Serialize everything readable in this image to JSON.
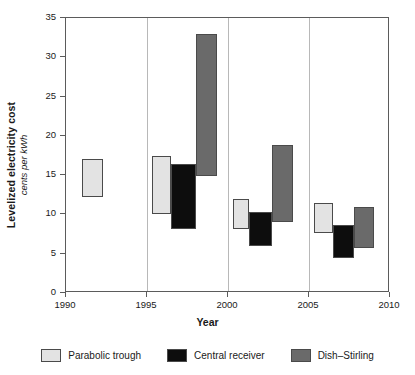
{
  "chart_data": {
    "type": "bar",
    "title": "",
    "xlabel": "Year",
    "ylabel": "Levelized electricity cost",
    "ylabel_sub": "cents per kWh",
    "xlim": [
      1990,
      2010
    ],
    "ylim": [
      0,
      35
    ],
    "yticks": [
      0,
      5,
      10,
      15,
      20,
      25,
      30,
      35
    ],
    "ytick_labels": [
      "0",
      "5",
      "10",
      "15",
      "20",
      "25",
      "30",
      "35"
    ],
    "xticks": [
      1990,
      1995,
      2000,
      2005,
      2010
    ],
    "xtick_labels": [
      "1990",
      "1995",
      "2000",
      "2005",
      "2010"
    ],
    "grid": "vertical gridlines at 1995, 2000, 2005",
    "legend_position": "below plot, horizontal",
    "note": "Each bar is a floating range bar spanning a low and high levelized cost over a span of years",
    "series": [
      {
        "name": "Parabolic trough",
        "color": "#e3e3e3",
        "bars": [
          {
            "x_start": 1991.0,
            "x_end": 1992.3,
            "low": 12.2,
            "high": 17.0
          },
          {
            "x_start": 1995.3,
            "x_end": 1996.5,
            "low": 10.1,
            "high": 17.5
          },
          {
            "x_start": 2000.3,
            "x_end": 2001.3,
            "low": 8.2,
            "high": 12.0
          },
          {
            "x_start": 2005.3,
            "x_end": 2006.5,
            "low": 7.6,
            "high": 11.4
          }
        ]
      },
      {
        "name": "Central receiver",
        "color": "#0d0d0d",
        "bars": [
          {
            "x_start": 1996.5,
            "x_end": 1998.0,
            "low": 8.2,
            "high": 16.4
          },
          {
            "x_start": 2001.3,
            "x_end": 2002.7,
            "low": 6.0,
            "high": 10.3
          },
          {
            "x_start": 2006.5,
            "x_end": 2007.8,
            "low": 4.5,
            "high": 8.6
          }
        ]
      },
      {
        "name": "Dish–Stirling",
        "color": "#6a6a6a",
        "bars": [
          {
            "x_start": 1998.0,
            "x_end": 1999.3,
            "low": 14.9,
            "high": 33.0
          },
          {
            "x_start": 2002.7,
            "x_end": 2004.0,
            "low": 9.0,
            "high": 18.9
          },
          {
            "x_start": 2007.8,
            "x_end": 2009.0,
            "low": 5.7,
            "high": 10.9
          }
        ]
      }
    ]
  },
  "legend": {
    "items": [
      {
        "label": "Parabolic trough",
        "color": "#e3e3e3"
      },
      {
        "label": "Central receiver",
        "color": "#0d0d0d"
      },
      {
        "label": "Dish–Stirling",
        "color": "#6a6a6a"
      }
    ]
  },
  "axes": {
    "x_title": "Year",
    "y_title": "Levelized electricity cost",
    "y_subtitle": "cents per kWh"
  },
  "colors": {
    "parabolic_trough": "#e3e3e3",
    "central_receiver": "#0d0d0d",
    "dish_stirling": "#6a6a6a",
    "frame": "#5b5b5b",
    "gridline": "#b8b8b8",
    "background": "#ffffff"
  }
}
